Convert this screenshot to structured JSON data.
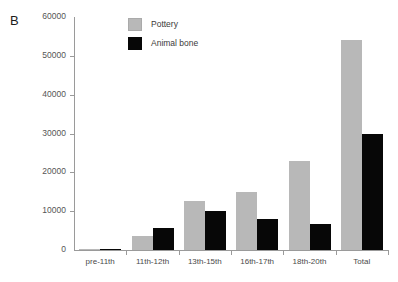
{
  "panel": {
    "label": "B"
  },
  "legend": {
    "position": "top-center",
    "items": [
      {
        "name": "Pottery",
        "color": "#b8b8b8",
        "swatch": "pottery-swatch"
      },
      {
        "name": "Animal bone",
        "color": "#070707",
        "swatch": "animal-bone-swatch"
      }
    ]
  },
  "axes": {
    "y_ticks": [
      "60000",
      "50000",
      "40000",
      "30000",
      "20000",
      "10000",
      "0"
    ],
    "x_ticks": [
      "pre-11th",
      "11th-12th",
      "13th-15th",
      "16th-17th",
      "18th-20th",
      "Total"
    ]
  },
  "chart_data": {
    "type": "bar",
    "title": "B",
    "xlabel": "",
    "ylabel": "",
    "ylim": [
      0,
      60000
    ],
    "ytick_step": 10000,
    "grid": false,
    "legend_position": "top-center",
    "categories": [
      "pre-11th",
      "11th-12th",
      "13th-15th",
      "16th-17th",
      "18th-20th",
      "Total"
    ],
    "series": [
      {
        "name": "Pottery",
        "color": "#b8b8b8",
        "values": [
          200,
          3500,
          12500,
          15000,
          23000,
          54200
        ]
      },
      {
        "name": "Animal bone",
        "color": "#070707",
        "values": [
          100,
          5600,
          10000,
          8000,
          6600,
          29800
        ]
      }
    ]
  }
}
